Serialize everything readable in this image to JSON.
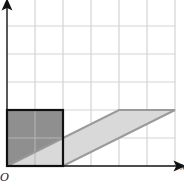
{
  "diagram": {
    "origin_label": "O",
    "x_axis_label": "x",
    "y_axis_label": "",
    "grid": {
      "cols": 6,
      "rows": 6,
      "unit_px": 28
    },
    "shapes": [
      {
        "name": "unit-square",
        "description": "dark shaded square",
        "vertices": [
          [
            0,
            0
          ],
          [
            2,
            0
          ],
          [
            2,
            2
          ],
          [
            0,
            2
          ]
        ],
        "fill": "#8f8f8f",
        "stroke": "#111111"
      },
      {
        "name": "sheared-parallelogram",
        "description": "light shaded parallelogram (shear image of the square)",
        "vertices": [
          [
            0,
            0
          ],
          [
            2,
            0
          ],
          [
            6,
            2
          ],
          [
            4,
            2
          ]
        ],
        "fill": "#d9d9d9",
        "stroke": "#9a9a9a"
      }
    ],
    "colors": {
      "grid": "#d4d4d4",
      "axis": "#111111",
      "square_fill": "#8f8f8f",
      "parallelogram_fill": "#d9d9d9",
      "parallelogram_edge": "#9a9a9a"
    }
  }
}
